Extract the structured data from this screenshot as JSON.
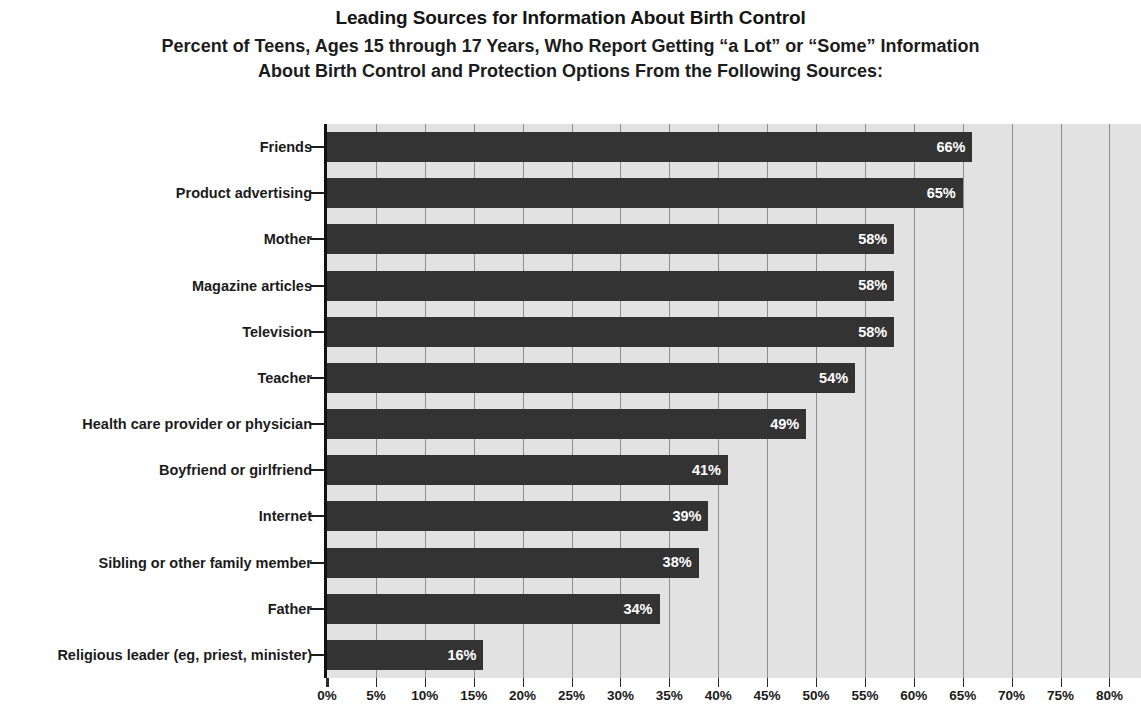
{
  "chart_data": {
    "type": "bar",
    "orientation": "horizontal",
    "title": "Leading Sources for Information About Birth Control",
    "subtitle_line1": "Percent of Teens, Ages 15 through 17 Years, Who Report Getting “a Lot” or “Some” Information",
    "subtitle_line2": "About Birth Control and Protection Options From the Following Sources:",
    "xlabel": "",
    "ylabel": "",
    "xlim": [
      0,
      85
    ],
    "grid": true,
    "legend": false,
    "categories": [
      "Friends",
      "Product advertising",
      "Mother",
      "Magazine articles",
      "Television",
      "Teacher",
      "Health care provider or physician",
      "Boyfriend or girlfriend",
      "Internet",
      "Sibling or other family member",
      "Father",
      "Religious leader (eg, priest, minister)"
    ],
    "values": [
      66,
      65,
      58,
      58,
      58,
      54,
      49,
      41,
      39,
      38,
      34,
      16
    ],
    "value_labels": [
      "66%",
      "65%",
      "58%",
      "58%",
      "58%",
      "54%",
      "49%",
      "41%",
      "39%",
      "38%",
      "34%",
      "16%"
    ],
    "xticks": [
      0,
      5,
      10,
      15,
      20,
      25,
      30,
      35,
      40,
      45,
      50,
      55,
      60,
      65,
      70,
      75,
      80,
      85
    ],
    "xtick_labels": [
      "0%",
      "5%",
      "10%",
      "15%",
      "20%",
      "25%",
      "30%",
      "35%",
      "40%",
      "45%",
      "50%",
      "55%",
      "60%",
      "65%",
      "70%",
      "75%",
      "80%",
      "85%"
    ],
    "colors": {
      "bar": "#333333",
      "plot_background": "#e2e2e2",
      "gridline": "#8e8e8e",
      "axis": "#111111",
      "value_label": "#ffffff",
      "text": "#1b1b1b",
      "page_background": "#ffffff"
    }
  }
}
